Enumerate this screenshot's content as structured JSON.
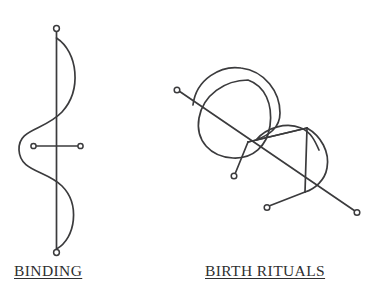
{
  "page": {
    "background_color": "#ffffff",
    "stroke_color": "#3b3b3d",
    "node_fill_color": "#ffffff",
    "width": 378,
    "height": 297
  },
  "figures": [
    {
      "id": "binding",
      "caption": "BINDING",
      "description": "Vertical staff with terminal rings, a serpentine S-curve woven across it, and a horizontal crossbar with rings at both ends",
      "nodes": 4
    },
    {
      "id": "birth-rituals",
      "caption": "BIRTH RITUALS",
      "description": "Rotated serpentine double-lobe glyph crossed by four straight rays converging at a central node, each ray terminating in a ring",
      "nodes": 4
    }
  ]
}
